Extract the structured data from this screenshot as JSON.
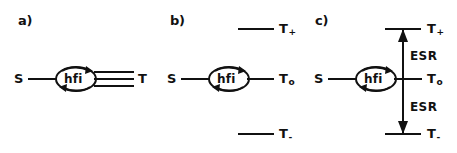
{
  "figure": {
    "background": "#ffffff",
    "ink_color": "#111111",
    "width": 457,
    "height": 153
  },
  "panels": [
    {
      "id": "a",
      "label": "a)",
      "left_state": "S",
      "coupling": "hfi",
      "right_states": [
        "T"
      ],
      "right_state_plain": "T",
      "degenerate_lines": 3
    },
    {
      "id": "b",
      "label": "b)",
      "left_state": "S",
      "coupling": "hfi",
      "levels": [
        {
          "base": "T",
          "sub": "+"
        },
        {
          "base": "T",
          "sub": "o"
        },
        {
          "base": "T",
          "sub": "-"
        }
      ]
    },
    {
      "id": "c",
      "label": "c)",
      "left_state": "S",
      "coupling": "hfi",
      "levels": [
        {
          "base": "T",
          "sub": "+"
        },
        {
          "base": "T",
          "sub": "o"
        },
        {
          "base": "T",
          "sub": "-"
        }
      ],
      "transitions": [
        {
          "name": "ESR",
          "from": "To",
          "to": "T+"
        },
        {
          "name": "ESR",
          "from": "To",
          "to": "T-"
        }
      ],
      "transition_label": "ESR"
    }
  ]
}
